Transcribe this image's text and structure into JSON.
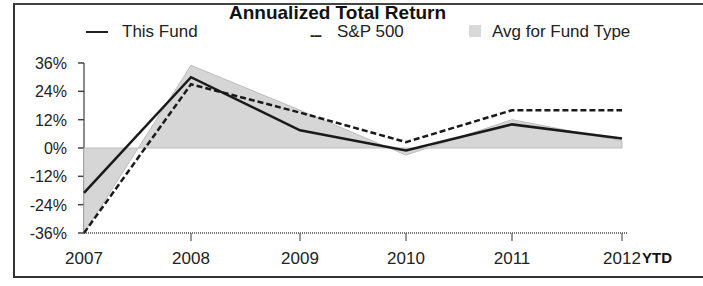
{
  "chart_data": {
    "type": "line",
    "title": "Annualized Total Return",
    "xlabel": "",
    "ylabel": "",
    "categories": [
      "2007",
      "2008",
      "2009",
      "2010",
      "2011",
      "2012"
    ],
    "x_suffix_label": "YTD",
    "ylim": [
      -36,
      36
    ],
    "yticks": [
      "36%",
      "24%",
      "12%",
      "0%",
      "-12%",
      "-24%",
      "-36%"
    ],
    "grid": false,
    "legend_position": "top",
    "series": [
      {
        "name": "This Fund",
        "style": "solid",
        "values": [
          -19,
          30,
          7.5,
          -1,
          10,
          4
        ]
      },
      {
        "name": "S&P 500",
        "style": "dashed",
        "values": [
          -36,
          27,
          15,
          2.5,
          16,
          16
        ]
      },
      {
        "name": "Avg for Fund Type",
        "style": "area",
        "values": [
          -36,
          35,
          16,
          -3,
          12,
          3
        ]
      }
    ]
  },
  "legend": {
    "fund": "This Fund",
    "sp": "S&P 500",
    "sp_marker": "---",
    "avg": "Avg for Fund Type"
  },
  "colors": {
    "fund": "#1a1a1a",
    "sp": "#1a1a1a",
    "avg_fill": "#d6d6d6",
    "avg_line": "#bdbdbd"
  }
}
